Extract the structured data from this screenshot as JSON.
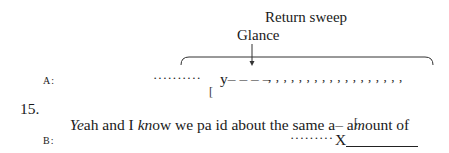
{
  "annotations": {
    "return_sweep": "Return sweep",
    "glance": "Glance"
  },
  "speaker_a": {
    "label": "A:",
    "dots_before": "··········",
    "glance_mark": "y– – – –",
    "return_sweep_marks": ", , , , , , , , , , , , , , , , , ,"
  },
  "overlap_bracket": "[",
  "line": {
    "number": "15.",
    "segments": [
      {
        "text": "Ye",
        "italic": true
      },
      {
        "text": "ah and I ",
        "italic": false
      },
      {
        "text": "kn",
        "italic": true
      },
      {
        "text": "ow we pa id about the same a– a",
        "italic": false
      },
      {
        "text": "m",
        "italic": true
      },
      {
        "text": "ount of",
        "italic": false
      }
    ]
  },
  "speaker_b": {
    "label": "B:",
    "dots_before": "·········",
    "gaze_mark": "X"
  }
}
